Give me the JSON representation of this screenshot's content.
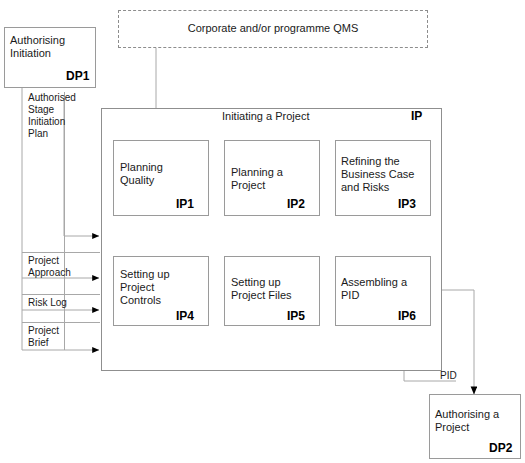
{
  "diagram": {
    "qms_box": {
      "label": "Corporate and/or programme QMS"
    },
    "dp1_box": {
      "label": "Authorising\nInitiation",
      "code": "DP1"
    },
    "dp2_box": {
      "label": "Authorising a\nProject",
      "code": "DP2"
    },
    "container": {
      "title": "Initiating a Project",
      "code": "IP"
    },
    "inputs": [
      {
        "label": "Authorised\nStage\nInitiation\nPlan"
      },
      {
        "label": "Project\nApproach"
      },
      {
        "label": "Risk Log"
      },
      {
        "label": "Project\nBrief"
      }
    ],
    "outputs": [
      {
        "label": "PID"
      }
    ],
    "processes": [
      {
        "label": "Planning\nQuality",
        "code": "IP1"
      },
      {
        "label": "Planning a\nProject",
        "code": "IP2"
      },
      {
        "label": "Refining the\nBusiness Case\nand Risks",
        "code": "IP3"
      },
      {
        "label": "Setting up\nProject\nControls",
        "code": "IP4"
      },
      {
        "label": "Setting up\nProject Files",
        "code": "IP5"
      },
      {
        "label": "Assembling a\nPID",
        "code": "IP6"
      }
    ],
    "colors": {
      "background": "#ffffff",
      "box_border": "#9a9a9a",
      "container_border": "#8f8f8f",
      "connector": "#a8a8a8",
      "arrowhead": "#000000",
      "text": "#1a1a1a",
      "code_text": "#000000"
    }
  }
}
